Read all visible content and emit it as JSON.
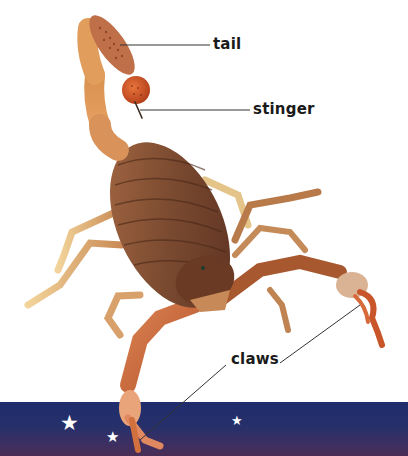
{
  "labels": {
    "tail": "tail",
    "stinger": "stinger",
    "claws": "claws"
  },
  "band": {
    "colors": [
      "#1f2d6e",
      "#4a2d55"
    ],
    "stars": [
      {
        "glyph": "★",
        "x": 60,
        "y": 414,
        "size": 20
      },
      {
        "glyph": "★",
        "x": 106,
        "y": 430,
        "size": 15
      },
      {
        "glyph": "★",
        "x": 231,
        "y": 414,
        "size": 13
      }
    ]
  },
  "colors": {
    "label_text": "#1a1a1a",
    "leader_line": "#333333",
    "body_dark": "#6b3a22",
    "body_mid": "#9a5a34",
    "leg_light": "#e8b877",
    "claw": "#c96a3c",
    "stinger_bulb": "#d4562a"
  }
}
